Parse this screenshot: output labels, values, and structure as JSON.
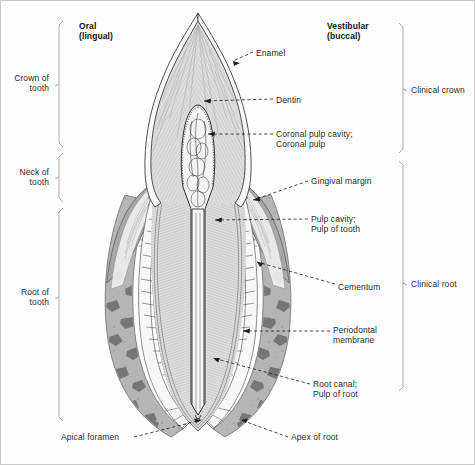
{
  "figure": {
    "type": "anatomical-diagram",
    "subject": "tooth",
    "width": 475,
    "height": 465
  },
  "orientation_headings": [
    {
      "id": "oral",
      "line1": "Oral",
      "line2": "(lingual)",
      "x": 78,
      "y": 22
    },
    {
      "id": "vestibular",
      "line1": "Vestibular",
      "line2": "(buccal)",
      "x": 326,
      "y": 22
    }
  ],
  "left_brackets": [
    {
      "id": "crown-of-tooth",
      "line1": "Crown of",
      "line2": "tooth",
      "top": 20,
      "bottom": 146,
      "label_y": 66
    },
    {
      "id": "neck-of-tooth",
      "line1": "Neck of",
      "line2": "tooth",
      "top": 152,
      "bottom": 201,
      "label_y": 165
    },
    {
      "id": "root-of-tooth",
      "line1": "Root of",
      "line2": "tooth",
      "top": 207,
      "bottom": 420,
      "label_y": 285
    }
  ],
  "right_brackets": [
    {
      "id": "clinical-crown",
      "label": "Clinical crown",
      "top": 22,
      "bottom": 152,
      "label_y": 82
    },
    {
      "id": "clinical-root",
      "label": "Clinical root",
      "top": 160,
      "bottom": 390,
      "label_y": 278
    }
  ],
  "callouts": [
    {
      "id": "enamel",
      "line1": "Enamel",
      "line2": "",
      "text_x": 255,
      "text_y": 50,
      "anchor_x": 226,
      "anchor_y": 62,
      "side": "right"
    },
    {
      "id": "dentin",
      "line1": "Dentin",
      "line2": "",
      "text_x": 275,
      "text_y": 97,
      "anchor_x": 200,
      "anchor_y": 100,
      "side": "right"
    },
    {
      "id": "coronal-pulp-cavity",
      "line1": "Coronal pulp cavity;",
      "line2": "Coronal pulp",
      "text_x": 275,
      "text_y": 134,
      "anchor_x": 205,
      "anchor_y": 134,
      "side": "right"
    },
    {
      "id": "gingival-margin",
      "line1": "Gingival margin",
      "line2": "",
      "text_x": 310,
      "text_y": 177,
      "anchor_x": 250,
      "anchor_y": 198,
      "side": "right"
    },
    {
      "id": "pulp-cavity",
      "line1": "Pulp cavity;",
      "line2": "Pulp of tooth",
      "text_x": 310,
      "text_y": 215,
      "anchor_x": 215,
      "anchor_y": 218,
      "side": "right"
    },
    {
      "id": "cementum",
      "line1": "Cementum",
      "line2": "",
      "text_x": 337,
      "text_y": 285,
      "anchor_x": 258,
      "anchor_y": 262,
      "side": "right"
    },
    {
      "id": "periodontal-membrane",
      "line1": "Periodontal",
      "line2": "membrane",
      "text_x": 332,
      "text_y": 328,
      "anchor_x": 244,
      "anchor_y": 329,
      "side": "right"
    },
    {
      "id": "root-canal",
      "line1": "Root canal;",
      "line2": "Pulp of root",
      "text_x": 312,
      "text_y": 381,
      "anchor_x": 212,
      "anchor_y": 357,
      "side": "right"
    },
    {
      "id": "apex-of-root",
      "line1": "Apex of root",
      "line2": "",
      "text_x": 290,
      "text_y": 434,
      "anchor_x": 238,
      "anchor_y": 418,
      "side": "right"
    },
    {
      "id": "apical-foramen",
      "line1": "Apical foramen",
      "line2": "",
      "text_x": 60,
      "text_y": 434,
      "anchor_x": 204,
      "anchor_y": 418,
      "side": "left"
    }
  ],
  "colors": {
    "enamel": "#fbfbfb",
    "dentin": "#dededc",
    "pulp": "#f2f2f1",
    "gingiva": "#a9a9a7",
    "bone": "#b5b5b2",
    "marrow": "#6e6e6c",
    "pdl": "#f6f6f5",
    "outline": "#3a3a3a",
    "leader": "#222222",
    "bracket": "#9a9a9a",
    "text": "#2b2b2b"
  }
}
